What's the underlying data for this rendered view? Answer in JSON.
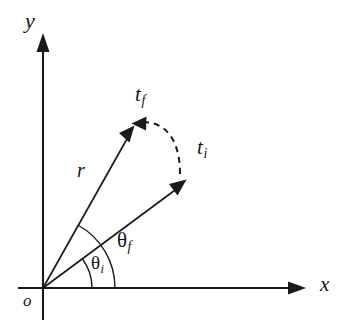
{
  "figure": {
    "background_color": "#ffffff",
    "stroke_color": "#1a1a1a",
    "width": 349,
    "height": 336
  },
  "axes": {
    "x_label": "x",
    "y_label": "y",
    "origin_label": "o",
    "origin": {
      "x": 43,
      "y": 288
    },
    "x_axis_tip": {
      "x": 305,
      "y": 288
    },
    "y_axis_tip": {
      "x": 43,
      "y": 35
    }
  },
  "vectors": [
    {
      "name": "final-vector",
      "label_text": "t",
      "label_sub": "f",
      "magnitude_label": "r",
      "angle_label": "θ",
      "angle_sub": "f",
      "angle_degrees": 61,
      "tip": {
        "x": 133,
        "y": 127
      },
      "style": "solid"
    },
    {
      "name": "initial-vector",
      "label_text": "t",
      "label_sub": "i",
      "magnitude_label": "r",
      "angle_label": "θ",
      "angle_sub": "i",
      "angle_degrees": 37,
      "tip": {
        "x": 185,
        "y": 181
      },
      "style": "solid"
    }
  ],
  "arcs": {
    "theta_i": {
      "label": "θ",
      "sub": "i",
      "radius": 49,
      "from_degrees": 0,
      "to_degrees": 37
    },
    "theta_f": {
      "label": "θ",
      "sub": "f",
      "radius": 72,
      "from_degrees": 0,
      "to_degrees": 61
    },
    "rotation_arc": {
      "name": "rotation-dashed-arc",
      "style": "dashed",
      "from": {
        "x": 185,
        "y": 181
      },
      "to": {
        "x": 133,
        "y": 127
      },
      "direction": "counterclockwise"
    }
  },
  "labels": {
    "r": "r",
    "t_base": "t",
    "t_final_sub": "f",
    "t_initial_sub": "i",
    "theta_base": "θ",
    "theta_final_sub": "f",
    "theta_initial_sub": "i",
    "x": "x",
    "y": "y",
    "origin": "o"
  }
}
